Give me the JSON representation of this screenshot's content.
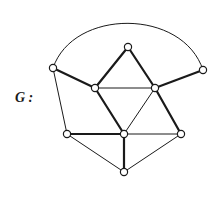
{
  "graph": {
    "label": "G :",
    "label_pos": {
      "x": 15,
      "y": 90
    },
    "colors": {
      "edge": "#1a1a1a",
      "vertex_stroke": "#1a1a1a",
      "vertex_fill": "#ffffff"
    },
    "vertices": [
      {
        "id": "A",
        "x": 53,
        "y": 68
      },
      {
        "id": "B",
        "x": 128,
        "y": 47
      },
      {
        "id": "C",
        "x": 203,
        "y": 70
      },
      {
        "id": "D",
        "x": 95,
        "y": 88
      },
      {
        "id": "E",
        "x": 155,
        "y": 88
      },
      {
        "id": "F",
        "x": 67,
        "y": 134
      },
      {
        "id": "H",
        "x": 124,
        "y": 134
      },
      {
        "id": "I",
        "x": 181,
        "y": 134
      },
      {
        "id": "J",
        "x": 124,
        "y": 172
      }
    ],
    "edges": [
      {
        "from": "A",
        "to": "C",
        "weight": "thin",
        "curve": "arc"
      },
      {
        "from": "A",
        "to": "D",
        "weight": "thick"
      },
      {
        "from": "A",
        "to": "F",
        "weight": "thin"
      },
      {
        "from": "B",
        "to": "D",
        "weight": "thick"
      },
      {
        "from": "B",
        "to": "E",
        "weight": "thick"
      },
      {
        "from": "C",
        "to": "E",
        "weight": "thick"
      },
      {
        "from": "D",
        "to": "E",
        "weight": "thin"
      },
      {
        "from": "D",
        "to": "H",
        "weight": "thick"
      },
      {
        "from": "E",
        "to": "H",
        "weight": "thin"
      },
      {
        "from": "E",
        "to": "I",
        "weight": "thick"
      },
      {
        "from": "F",
        "to": "H",
        "weight": "thick"
      },
      {
        "from": "F",
        "to": "J",
        "weight": "thin"
      },
      {
        "from": "H",
        "to": "I",
        "weight": "thin"
      },
      {
        "from": "H",
        "to": "J",
        "weight": "thick"
      },
      {
        "from": "I",
        "to": "J",
        "weight": "thin"
      }
    ]
  }
}
